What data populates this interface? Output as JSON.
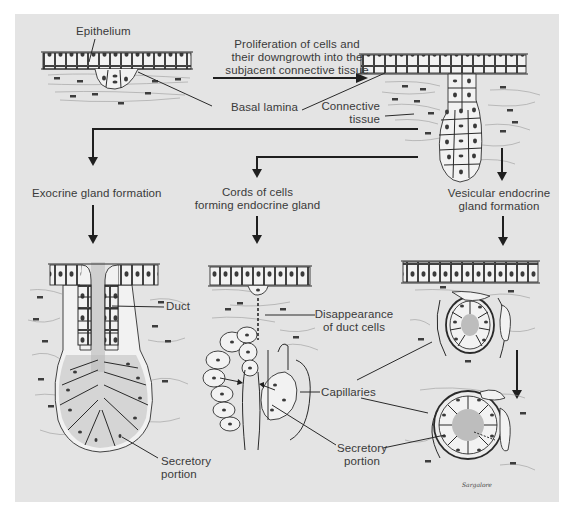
{
  "figure": {
    "background_color": "#e4e4e4",
    "line_color": "#2a2a2a",
    "text_color": "#3a3a3a"
  },
  "labels": {
    "epithelium": "Epithelium",
    "proliferation_line1": "Proliferation of cells and",
    "proliferation_line2": "their downgrowth into the",
    "proliferation_line3": "subjacent connective tissue",
    "basal_lamina": "Basal lamina",
    "connective_line1": "Connective",
    "connective_line2": "tissue",
    "exocrine": "Exocrine gland formation",
    "cords_line1": "Cords of cells",
    "cords_line2": "forming endocrine gland",
    "vesicular_line1": "Vesicular endocrine",
    "vesicular_line2": "gland formation",
    "duct": "Duct",
    "disappearance_line1": "Disappearance",
    "disappearance_line2": "of duct cells",
    "capillaries": "Capillaries",
    "secretory_exo_line1": "Secretory",
    "secretory_exo_line2": "portion",
    "secretory_endo_line1": "Secretory",
    "secretory_endo_line2": "portion",
    "signature": "Sargalore"
  },
  "panels": [
    {
      "id": "initial-epithelium",
      "description": "Epithelium with small downgrowth"
    },
    {
      "id": "proliferated-epithelium",
      "description": "Cell cord growing into connective tissue"
    },
    {
      "id": "exocrine-gland",
      "description": "Exocrine gland with duct and secretory portion"
    },
    {
      "id": "cord-endocrine-gland",
      "description": "Cords of cells forming endocrine gland"
    },
    {
      "id": "vesicular-endocrine-gland",
      "description": "Vesicular endocrine gland, two stages"
    }
  ]
}
